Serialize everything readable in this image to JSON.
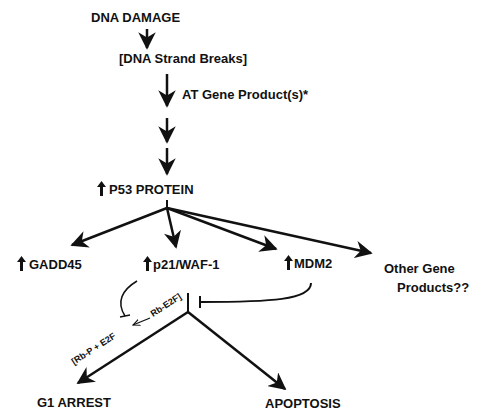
{
  "colors": {
    "ink": "#111111",
    "background": "#ffffff"
  },
  "nodes": {
    "dna_damage": "DNA DAMAGE",
    "strand_breaks": "[DNA Strand Breaks]",
    "at_gene": "AT Gene Product(s)*",
    "p53": "P53 PROTEIN",
    "gadd45": "GADD45",
    "p21": "p21/WAF-1",
    "mdm2": "MDM2",
    "other_line1": "Other Gene",
    "other_line2": "Products??",
    "rb_e2f": "Rb-E2F]",
    "rb_p_e2f": "[Rb-P + E2F",
    "g1_arrest": "G1 ARREST",
    "apoptosis": "APOPTOSIS"
  },
  "edges": [
    {
      "from": "DNA DAMAGE",
      "to": "[DNA Strand Breaks]",
      "type": "activates"
    },
    {
      "from": "[DNA Strand Breaks]",
      "to": "intermediate",
      "type": "activates",
      "label": "AT Gene Product(s)*"
    },
    {
      "from": "intermediate",
      "to": "P53 PROTEIN",
      "type": "activates"
    },
    {
      "from": "P53 PROTEIN",
      "to": "GADD45",
      "type": "activates"
    },
    {
      "from": "P53 PROTEIN",
      "to": "p21/WAF-1",
      "type": "activates"
    },
    {
      "from": "P53 PROTEIN",
      "to": "MDM2",
      "type": "activates"
    },
    {
      "from": "P53 PROTEIN",
      "to": "Other Gene Products??",
      "type": "activates"
    },
    {
      "from": "p21/WAF-1",
      "to": "Rb-E2F conversion",
      "type": "inhibits"
    },
    {
      "from": "MDM2",
      "to": "branch point",
      "type": "inhibits"
    },
    {
      "from": "branch point",
      "to": "G1 ARREST",
      "type": "activates"
    },
    {
      "from": "branch point",
      "to": "APOPTOSIS",
      "type": "activates"
    }
  ],
  "icons": {
    "up_arrow": "increase-indicator",
    "down_arrow": "activation-arrow",
    "t_bar": "inhibition-bar"
  }
}
